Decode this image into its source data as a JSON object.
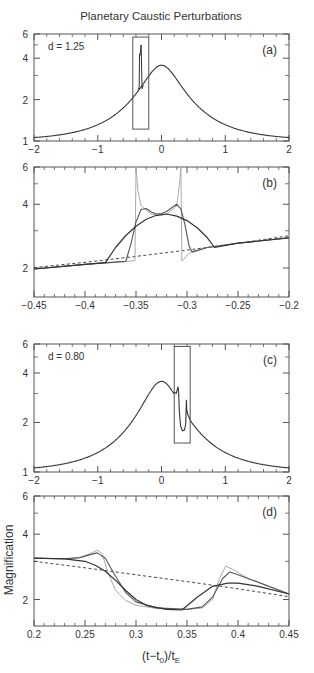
{
  "title": "Planetary Caustic Perturbations",
  "xlabel_main": "(t−t",
  "xlabel_sub0": "0",
  "xlabel_mid": ")/t",
  "xlabel_subE": "E",
  "ylabel": "Magnification",
  "colors": {
    "dark": "#333333",
    "mid": "#555555",
    "light": "#aaaaaa",
    "frame": "#555555"
  },
  "chart_data": [
    {
      "id": "a",
      "type": "line",
      "panel_label": "(a)",
      "annotation": "d = 1.25",
      "yscale": "log",
      "xlim": [
        -2,
        2
      ],
      "ylim": [
        1,
        6
      ],
      "xticks": [
        -2,
        -1,
        0,
        1,
        2
      ],
      "xtick_labels": [
        "−2",
        "−1",
        "0",
        "1",
        "2"
      ],
      "yticks": [
        1,
        2,
        4,
        6
      ],
      "ytick_labels": [
        "1",
        "2",
        "4",
        "6"
      ],
      "u0": 0.29,
      "zoom_box": {
        "x": [
          -0.45,
          -0.2
        ],
        "y": [
          1.22,
          5.7
        ]
      },
      "perturbation": {
        "t_left": -0.35,
        "t_right": -0.305,
        "peak": 5.0
      }
    },
    {
      "id": "b",
      "type": "line",
      "panel_label": "(b)",
      "yscale": "log",
      "xlim": [
        -0.45,
        -0.2
      ],
      "ylim": [
        1.46,
        6
      ],
      "xticks": [
        -0.45,
        -0.4,
        -0.35,
        -0.3,
        -0.25,
        -0.2
      ],
      "xtick_labels": [
        "−0.45",
        "−0.4",
        "−0.35",
        "−0.3",
        "−0.25",
        "−0.2"
      ],
      "yticks": [
        2,
        4,
        6
      ],
      "ytick_labels": [
        "2",
        "4",
        "6"
      ],
      "series": [
        {
          "name": "unperturbed",
          "style": "dashed",
          "x": [
            -0.45,
            -0.4,
            -0.35,
            -0.3,
            -0.25,
            -0.2
          ],
          "y": [
            2.01,
            2.13,
            2.27,
            2.43,
            2.62,
            2.84
          ]
        },
        {
          "name": "small source",
          "style": "light",
          "x": [
            -0.45,
            -0.4,
            -0.355,
            -0.351,
            -0.35,
            -0.348,
            -0.345,
            -0.34,
            -0.335,
            -0.33,
            -0.325,
            -0.32,
            -0.315,
            -0.31,
            -0.307,
            -0.306,
            -0.305,
            -0.303,
            -0.3,
            -0.295,
            -0.28,
            -0.25,
            -0.2
          ],
          "y": [
            1.98,
            2.08,
            2.16,
            2.17,
            6.0,
            4.6,
            3.95,
            3.75,
            3.6,
            3.55,
            3.55,
            3.6,
            3.75,
            3.95,
            5.2,
            6.0,
            2.16,
            2.2,
            2.3,
            2.4,
            2.5,
            2.62,
            2.78
          ]
        },
        {
          "name": "medium source",
          "style": "mid",
          "x": [
            -0.45,
            -0.4,
            -0.36,
            -0.355,
            -0.35,
            -0.345,
            -0.34,
            -0.335,
            -0.33,
            -0.325,
            -0.32,
            -0.315,
            -0.31,
            -0.306,
            -0.302,
            -0.298,
            -0.295,
            -0.28,
            -0.25,
            -0.2
          ],
          "y": [
            1.98,
            2.08,
            2.15,
            2.6,
            3.3,
            3.78,
            3.82,
            3.68,
            3.6,
            3.62,
            3.7,
            3.85,
            4.0,
            3.8,
            3.2,
            2.55,
            2.38,
            2.5,
            2.62,
            2.78
          ]
        },
        {
          "name": "large source",
          "style": "dark",
          "x": [
            -0.45,
            -0.4,
            -0.38,
            -0.37,
            -0.36,
            -0.35,
            -0.34,
            -0.33,
            -0.32,
            -0.31,
            -0.3,
            -0.29,
            -0.28,
            -0.273,
            -0.25,
            -0.2
          ],
          "y": [
            1.98,
            2.08,
            2.12,
            2.5,
            2.85,
            3.15,
            3.4,
            3.55,
            3.6,
            3.52,
            3.35,
            3.1,
            2.78,
            2.5,
            2.62,
            2.78
          ]
        }
      ]
    },
    {
      "id": "c",
      "type": "line",
      "panel_label": "(c)",
      "annotation": "d = 0.80",
      "yscale": "log",
      "xlim": [
        -2,
        2
      ],
      "ylim": [
        1,
        6
      ],
      "xticks": [
        -2,
        -1,
        0,
        1,
        2
      ],
      "xtick_labels": [
        "−2",
        "−1",
        "0",
        "1",
        "2"
      ],
      "yticks": [
        1,
        2,
        4,
        6
      ],
      "ytick_labels": [
        "1",
        "2",
        "4",
        "6"
      ],
      "u0": 0.29,
      "zoom_box": {
        "x": [
          0.2,
          0.45
        ],
        "y": [
          1.5,
          5.8
        ]
      },
      "perturbation_points": {
        "x": [
          0.2,
          0.23,
          0.26,
          0.27,
          0.28,
          0.3,
          0.33,
          0.36,
          0.38,
          0.39,
          0.395,
          0.41,
          0.45
        ],
        "y": [
          3.05,
          3.0,
          3.3,
          3.0,
          2.3,
          1.9,
          1.78,
          1.8,
          1.95,
          2.75,
          2.4,
          2.25,
          2.08
        ]
      }
    },
    {
      "id": "d",
      "type": "line",
      "panel_label": "(d)",
      "yscale": "log",
      "xlim": [
        0.2,
        0.45
      ],
      "ylim": [
        1.51,
        6
      ],
      "xticks": [
        0.2,
        0.25,
        0.3,
        0.35,
        0.4,
        0.45
      ],
      "xtick_labels": [
        "0.2",
        "0.25",
        "0.3",
        "0.35",
        "0.4",
        "0.45"
      ],
      "yticks": [
        2,
        4,
        6
      ],
      "ytick_labels": [
        "2",
        "4",
        "6"
      ],
      "series": [
        {
          "name": "unperturbed",
          "style": "dashed",
          "x": [
            0.2,
            0.25,
            0.3,
            0.35,
            0.4,
            0.45
          ],
          "y": [
            3.0,
            2.8,
            2.6,
            2.42,
            2.24,
            2.06
          ]
        },
        {
          "name": "small source",
          "style": "light",
          "x": [
            0.2,
            0.23,
            0.245,
            0.255,
            0.262,
            0.267,
            0.272,
            0.28,
            0.29,
            0.3,
            0.32,
            0.35,
            0.365,
            0.375,
            0.382,
            0.388,
            0.395,
            0.41,
            0.45
          ],
          "y": [
            3.1,
            3.08,
            3.12,
            3.25,
            3.38,
            3.25,
            2.7,
            2.2,
            1.98,
            1.88,
            1.82,
            1.8,
            1.83,
            2.0,
            2.5,
            2.85,
            2.75,
            2.5,
            2.12
          ]
        },
        {
          "name": "medium source",
          "style": "mid",
          "x": [
            0.2,
            0.23,
            0.245,
            0.255,
            0.262,
            0.27,
            0.278,
            0.29,
            0.3,
            0.32,
            0.35,
            0.365,
            0.375,
            0.385,
            0.392,
            0.4,
            0.415,
            0.45
          ],
          "y": [
            3.1,
            3.08,
            3.12,
            3.22,
            3.28,
            3.1,
            2.65,
            2.15,
            1.95,
            1.83,
            1.8,
            1.85,
            2.05,
            2.5,
            2.68,
            2.6,
            2.45,
            2.12
          ]
        },
        {
          "name": "large source",
          "style": "dark",
          "x": [
            0.2,
            0.23,
            0.25,
            0.26,
            0.27,
            0.28,
            0.29,
            0.3,
            0.31,
            0.33,
            0.345,
            0.36,
            0.375,
            0.39,
            0.4,
            0.42,
            0.45
          ],
          "y": [
            3.1,
            3.08,
            3.0,
            2.88,
            2.7,
            2.45,
            2.2,
            2.0,
            1.88,
            1.8,
            1.79,
            2.05,
            2.3,
            2.38,
            2.38,
            2.3,
            2.12
          ]
        }
      ]
    }
  ]
}
